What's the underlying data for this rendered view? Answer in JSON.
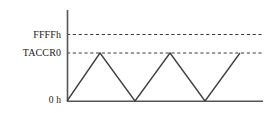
{
  "figure": {
    "name": "timer-updown-mode-waveform",
    "background_color": "#ffffff",
    "line_color": "#404040",
    "axis_color": "#555555",
    "text_color": "#1a1a1a"
  },
  "labels": {
    "max_count": "FFFFh",
    "compare_register": "TACCR0",
    "zero": "0 h"
  },
  "chart_data": {
    "type": "line",
    "title": "",
    "xlabel": "",
    "ylabel": "",
    "grid": false,
    "legend": "none",
    "axis": {
      "y_axis_x_px": 67,
      "y_axis_top_px": 10,
      "baseline_y_px": 101,
      "plot_right_px": 263
    },
    "y_levels": [
      {
        "name": "FFFFh",
        "label": "FFFFh",
        "y_px": 34.5,
        "style": "dashed",
        "value": 65535
      },
      {
        "name": "TACCR0",
        "label": "TACCR0",
        "y_px": 53,
        "style": "dashed",
        "value": null
      },
      {
        "name": "0h",
        "label": "0 h",
        "y_px": 101,
        "style": "solid",
        "value": 0
      }
    ],
    "series": [
      {
        "name": "timer-count",
        "shape": "triangle",
        "points": [
          {
            "x": 67,
            "y": 101,
            "level": "0h"
          },
          {
            "x": 100,
            "y": 53,
            "level": "TACCR0"
          },
          {
            "x": 135,
            "y": 101,
            "level": "0h"
          },
          {
            "x": 170,
            "y": 53,
            "level": "TACCR0"
          },
          {
            "x": 205,
            "y": 101,
            "level": "0h"
          },
          {
            "x": 240,
            "y": 53,
            "level": "TACCR0"
          }
        ]
      }
    ]
  }
}
